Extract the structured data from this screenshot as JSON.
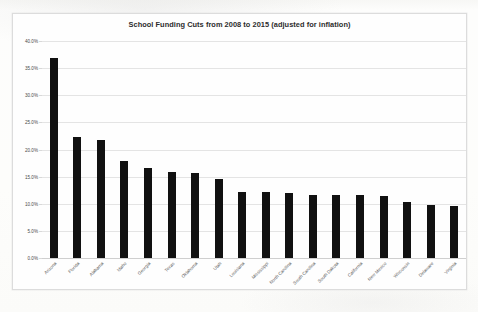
{
  "chart_data": {
    "type": "bar",
    "title": "School Funding Cuts from 2008 to 2015 (adjusted for inflation)",
    "xlabel": "",
    "ylabel": "",
    "ylim": [
      0,
      40
    ],
    "grid": true,
    "legend": "none",
    "orientation": "vertical",
    "bar_color": "#111111",
    "ytick_labels": [
      "40.0%",
      "35.0%",
      "30.0%",
      "25.0%",
      "20.0%",
      "15.0%",
      "10.0%",
      "5.0%",
      "0.0%"
    ],
    "ytick_values": [
      40.0,
      35.0,
      30.0,
      25.0,
      20.0,
      15.0,
      10.0,
      5.0,
      0.0
    ],
    "categories": [
      "Arizona",
      "Florida",
      "Alabama",
      "Idaho",
      "Georgia",
      "Texas",
      "Oklahoma",
      "Utah",
      "Louisiana",
      "Mississippi",
      "North Carolina",
      "South Carolina",
      "South Dakota",
      "California",
      "New Mexico",
      "Wisconsin",
      "Delaware",
      "Virginia"
    ],
    "values": [
      36.9,
      22.3,
      21.8,
      17.9,
      16.6,
      15.9,
      15.6,
      14.6,
      12.1,
      12.1,
      11.9,
      11.7,
      11.6,
      11.6,
      11.5,
      10.3,
      9.7,
      9.6
    ]
  }
}
